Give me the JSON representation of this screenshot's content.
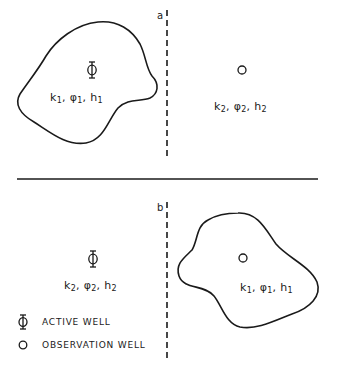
{
  "diagram": {
    "type": "two-panel well configuration schematic",
    "divider": {
      "orientation": "horizontal",
      "y": 179,
      "x1": 17,
      "x2": 318
    },
    "panels": [
      {
        "id": "a",
        "tag": "a",
        "boundary": {
          "type": "dashed vertical line",
          "x": 167,
          "y1": 10,
          "y2": 157
        },
        "regions": [
          {
            "id": "region-1",
            "shape": "closed irregular outline",
            "well": "active",
            "well_symbol": "Φ",
            "params": {
              "k": "k",
              "k_sub": "1",
              "phi": "φ",
              "phi_sub": "1",
              "h": "h",
              "h_sub": "1"
            }
          },
          {
            "id": "region-2",
            "shape": "open (unbounded)",
            "well": "observation",
            "well_symbol": "○",
            "params": {
              "k": "k",
              "k_sub": "2",
              "phi": "φ",
              "phi_sub": "2",
              "h": "h",
              "h_sub": "2"
            }
          }
        ]
      },
      {
        "id": "b",
        "tag": "b",
        "boundary": {
          "type": "dashed vertical line",
          "x": 167,
          "y1": 202,
          "y2": 358
        },
        "regions": [
          {
            "id": "region-2",
            "shape": "open (unbounded)",
            "well": "active",
            "well_symbol": "Φ",
            "params": {
              "k": "k",
              "k_sub": "2",
              "phi": "φ",
              "phi_sub": "2",
              "h": "h",
              "h_sub": "2"
            }
          },
          {
            "id": "region-1",
            "shape": "closed irregular outline",
            "well": "observation",
            "well_symbol": "○",
            "params": {
              "k": "k",
              "k_sub": "1",
              "phi": "φ",
              "phi_sub": "1",
              "h": "h",
              "h_sub": "1"
            }
          }
        ]
      }
    ],
    "legend": {
      "items": [
        {
          "symbol": "Φ",
          "label": "ACTIVE WELL"
        },
        {
          "symbol": "○",
          "label": "OBSERVATION WELL"
        }
      ]
    },
    "colors": {
      "ink": "#1a1a1a",
      "background": "#ffffff"
    }
  }
}
